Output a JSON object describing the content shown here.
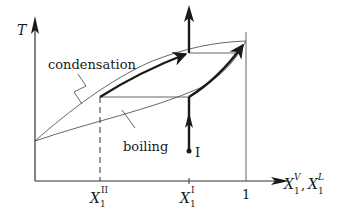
{
  "figure": {
    "type": "T-x phase diagram (boiling/condensation lens)",
    "axes": {
      "y_label": "T",
      "x_label_main": "X",
      "x_label_sub1": "1",
      "x_label_sup1": "V",
      "x_label_sep": ",",
      "x_label_sub2": "1",
      "x_label_sup2": "L"
    },
    "ticks": {
      "x_II": {
        "main": "X",
        "sub": "1",
        "sup": "II"
      },
      "x_I": {
        "main": "X",
        "sub": "1",
        "sup": "I"
      },
      "x_one": "1"
    },
    "curves": {
      "upper_label": "condensation",
      "lower_label": "boiling"
    },
    "point": {
      "label": "I"
    },
    "colors": {
      "line": "#1a1a1a",
      "thin_line": "#555555",
      "background": "#ffffff"
    }
  }
}
